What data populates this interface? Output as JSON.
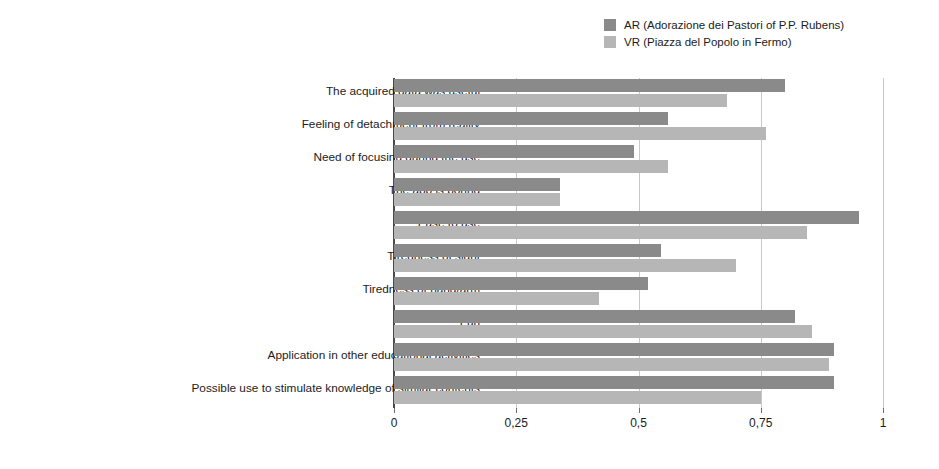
{
  "chart_data": {
    "type": "bar",
    "orientation": "horizontal",
    "title": "",
    "subtitle": "",
    "xlabel": "",
    "ylabel": "",
    "xlim": [
      0,
      1
    ],
    "grid": true,
    "legend_position": "top-right",
    "xtick_labels": [
      "0",
      "0,25",
      "0,5",
      "0,75",
      "1"
    ],
    "xtick_values": [
      0,
      0.25,
      0.5,
      0.75,
      1
    ],
    "categories": [
      "The acquired data was useful",
      "Feeling of detachment from reality",
      "Need of focusing during the use",
      "The app is boring",
      "Ease to use",
      "Tiredness of sight",
      "Tiredness of hand/arm",
      "Fun",
      "Application in other educational activities",
      "Possible use to stimulate knowledge of similar contents"
    ],
    "series": [
      {
        "name": "AR (Adorazione dei Pastori of P.P. Rubens)",
        "color": "#8a8a8a",
        "values": [
          0.8,
          0.56,
          0.49,
          0.34,
          0.95,
          0.545,
          0.52,
          0.82,
          0.9,
          0.9
        ]
      },
      {
        "name": "VR (Piazza del Popolo in Fermo)",
        "color": "#b6b6b6",
        "values": [
          0.68,
          0.76,
          0.56,
          0.34,
          0.845,
          0.7,
          0.42,
          0.855,
          0.89,
          0.75
        ]
      }
    ]
  },
  "legend": {
    "entries": [
      {
        "label": "AR (Adorazione dei Pastori of P.P. Rubens)",
        "color": "#8a8a8a"
      },
      {
        "label": "VR (Piazza del Popolo in Fermo)",
        "color": "#b6b6b6"
      }
    ]
  },
  "colors": {
    "series_ar": "#8a8a8a",
    "series_vr": "#b6b6b6",
    "axis": "#4a4a4a",
    "gridline": "#c9c9c9",
    "text": "#1c1c1c",
    "background": "#ffffff"
  }
}
